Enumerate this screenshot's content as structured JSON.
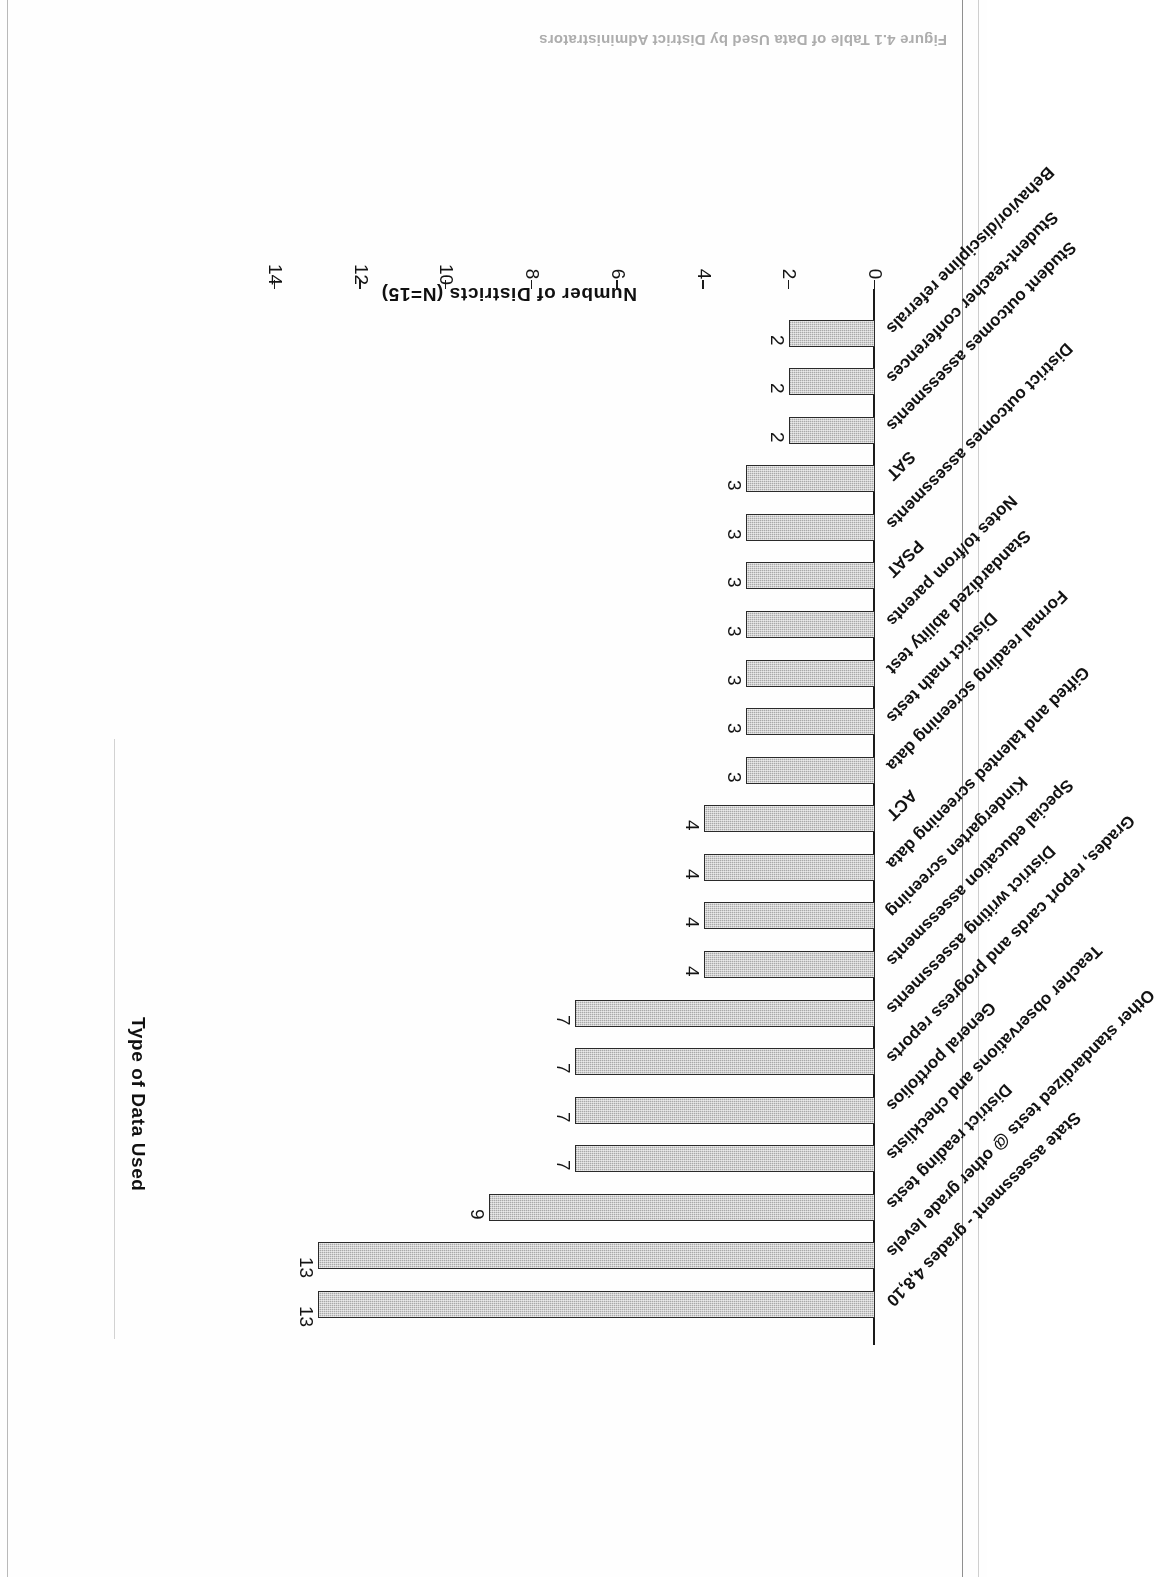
{
  "page": {
    "caption": "Figure 4.1   Table of Data Used by District Administrators"
  },
  "chart_data": {
    "type": "bar",
    "orientation": "horizontal",
    "title": "",
    "xlabel": "Type of Data Used",
    "ylabel": "Number of Districts (N=15)",
    "ylim": [
      0,
      14
    ],
    "yticks": [
      0,
      2,
      4,
      6,
      8,
      10,
      12,
      14
    ],
    "grid": false,
    "legend": false,
    "bar_fill_color": "#a9a9a9",
    "bar_border_color": "#2a2a2a",
    "categories": [
      "State assessment - grades 4,8,10",
      "Other standardized tests @ other grade levels",
      "District reading tests",
      "Teacher observations and checklists",
      "General portfolios",
      "Grades, report cards and progress reports",
      "District writing assessments",
      "Special education assessments",
      "Kindergarten screening",
      "Gifted and talented screening data",
      "ACT",
      "Formal reading screening data",
      "District math tests",
      "Standardized ability test",
      "Notes to/from parents",
      "PSAT",
      "District outcomes assessments",
      "SAT",
      "Student outcomes assessments",
      "Student-teacher conferences",
      "Behavior/discipline referrals"
    ],
    "values": [
      13,
      13,
      9,
      7,
      7,
      7,
      7,
      4,
      4,
      4,
      4,
      3,
      3,
      3,
      3,
      3,
      3,
      3,
      2,
      2,
      2
    ]
  }
}
